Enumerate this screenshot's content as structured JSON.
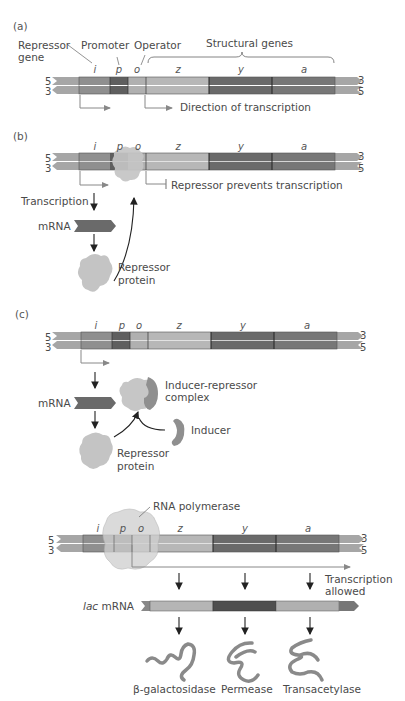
{
  "colors": {
    "tail": "#a6a6a6",
    "i": "#8f8f8f",
    "p": "#5f5f5f",
    "o": "#b0b0b0",
    "z": "#b7b7b7",
    "y": "#6a6a6a",
    "a": "#777777",
    "arrow": "#888888",
    "protein": "#c8c8c8",
    "inducer": "#909090",
    "enzyme": "#8a8a8a"
  },
  "genes": [
    "i",
    "p",
    "o",
    "z",
    "y",
    "a"
  ],
  "strand_labels": {
    "top_left": "5",
    "bottom_left": "3",
    "top_right": "3",
    "bottom_right": "5"
  },
  "panel_a": {
    "label": "(a)",
    "repressor_gene_line1": "Repressor",
    "repressor_gene_line2": "gene",
    "promoter": "Promoter",
    "operator": "Operator",
    "structural_genes": "Structural genes",
    "direction": "Direction of transcription"
  },
  "panel_b": {
    "label": "(b)",
    "repressor_prevents": "Repressor prevents transcription",
    "transcription": "Transcription",
    "mrna": "mRNA",
    "repressor_protein_line1": "Repressor",
    "repressor_protein_line2": "protein"
  },
  "panel_c": {
    "label": "(c)",
    "mrna": "mRNA",
    "complex_line1": "Inducer-repressor",
    "complex_line2": "complex",
    "inducer": "Inducer",
    "repressor_protein_line1": "Repressor",
    "repressor_protein_line2": "protein"
  },
  "panel_d": {
    "rna_polymerase": "RNA polymerase",
    "transcription_allowed_line1": "Transcription",
    "transcription_allowed_line2": "allowed",
    "lac": "lac",
    "mrna": "mRNA",
    "enzymes": [
      "β-galactosidase",
      "Permease",
      "Transacetylase"
    ]
  }
}
